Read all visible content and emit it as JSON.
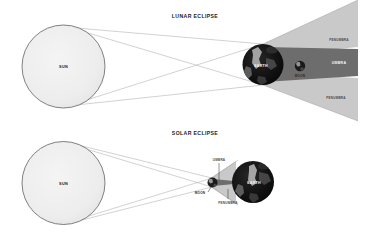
{
  "figure": {
    "kind": "eclipse-diagram",
    "background": "#ffffff"
  },
  "colors": {
    "sun_fill": "#ededed",
    "sun_stroke": "#4d4d4d",
    "earth_dark": "#0d0d0d",
    "moon_dark": "#111111",
    "penumbra": "#c9c9c9",
    "umbra": "#6d6d6d",
    "ray": "#9a9a9a",
    "text_dark": "#171717",
    "text_light": "#f2f2f2"
  },
  "panels": [
    {
      "id": "lunar",
      "title": "LUNAR ECLIPSE",
      "bodies": [
        {
          "name": "SUN",
          "label": "SUN",
          "label_style": "dark"
        },
        {
          "name": "EARTH",
          "label": "EARTH",
          "label_style": "light"
        },
        {
          "name": "MOON",
          "label": "MOON",
          "label_style": "dark"
        }
      ],
      "shadow_regions": [
        {
          "name": "penumbra-upper",
          "label": "PENUMBRA"
        },
        {
          "name": "umbra",
          "label": "UMBRA"
        },
        {
          "name": "penumbra-lower",
          "label": "PENUMBRA"
        }
      ]
    },
    {
      "id": "solar",
      "title": "SOLAR ECLIPSE",
      "bodies": [
        {
          "name": "SUN",
          "label": "SUN",
          "label_style": "dark"
        },
        {
          "name": "MOON",
          "label": "MOON",
          "label_style": "dark"
        },
        {
          "name": "EARTH",
          "label": "EARTH",
          "label_style": "light"
        }
      ],
      "shadow_regions": [
        {
          "name": "umbra",
          "label": "UMBRA"
        },
        {
          "name": "penumbra",
          "label": "PENUMBRA"
        }
      ]
    }
  ]
}
